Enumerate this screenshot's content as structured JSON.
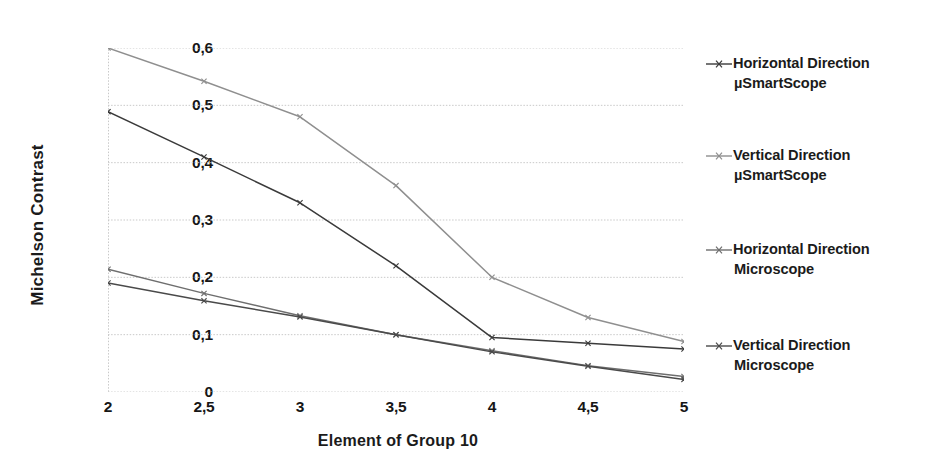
{
  "chart_data": {
    "type": "line",
    "title": "",
    "xlabel": "Element of Group 10",
    "ylabel": "Michelson Contrast",
    "xlim": [
      2,
      5
    ],
    "ylim": [
      0,
      0.6
    ],
    "grid": true,
    "legend_position": "right",
    "decimal_separator": ",",
    "x": [
      2,
      2.5,
      3,
      3.5,
      4,
      4.5,
      5
    ],
    "xtick_labels": [
      "2",
      "2,5",
      "3",
      "3,5",
      "4",
      "4,5",
      "5"
    ],
    "ytick_labels": [
      "0",
      "0,1",
      "0,2",
      "0,3",
      "0,4",
      "0,5",
      "0,6"
    ],
    "ytick_values": [
      0,
      0.1,
      0.2,
      0.3,
      0.4,
      0.5,
      0.6
    ],
    "series": [
      {
        "name": "Horizontal Direction µSmartScope",
        "label_line1": "Horizontal Direction",
        "label_line2": "µSmartScope",
        "color": "#3a3a3a",
        "values": [
          0.489,
          0.41,
          0.33,
          0.22,
          0.095,
          0.085,
          0.075
        ]
      },
      {
        "name": "Vertical Direction µSmartScope",
        "label_line1": "Vertical Direction",
        "label_line2": "µSmartScope",
        "color": "#8f8f8f",
        "values": [
          0.6,
          0.542,
          0.48,
          0.36,
          0.2,
          0.13,
          0.088
        ]
      },
      {
        "name": "Horizontal Direction Microscope",
        "label_line1": "Horizontal Direction",
        "label_line2": "Microscope",
        "color": "#6e6e6e",
        "values": [
          0.214,
          0.172,
          0.133,
          0.1,
          0.072,
          0.046,
          0.027
        ]
      },
      {
        "name": "Vertical Direction Microscope",
        "label_line1": "Vertical Direction",
        "label_line2": "Microscope",
        "color": "#4a4a4a",
        "values": [
          0.19,
          0.159,
          0.131,
          0.1,
          0.07,
          0.045,
          0.022
        ]
      }
    ]
  },
  "legend": {
    "items": [
      {
        "line1": "Horizontal Direction",
        "line2": "µSmartScope",
        "color": "#3a3a3a",
        "top": 8
      },
      {
        "line1": "Vertical Direction",
        "line2": "µSmartScope",
        "color": "#8f8f8f",
        "top": 100
      },
      {
        "line1": "Horizontal Direction",
        "line2": "Microscope",
        "color": "#6e6e6e",
        "top": 194
      },
      {
        "line1": "Vertical Direction",
        "line2": "Microscope",
        "color": "#4a4a4a",
        "top": 290
      }
    ]
  }
}
